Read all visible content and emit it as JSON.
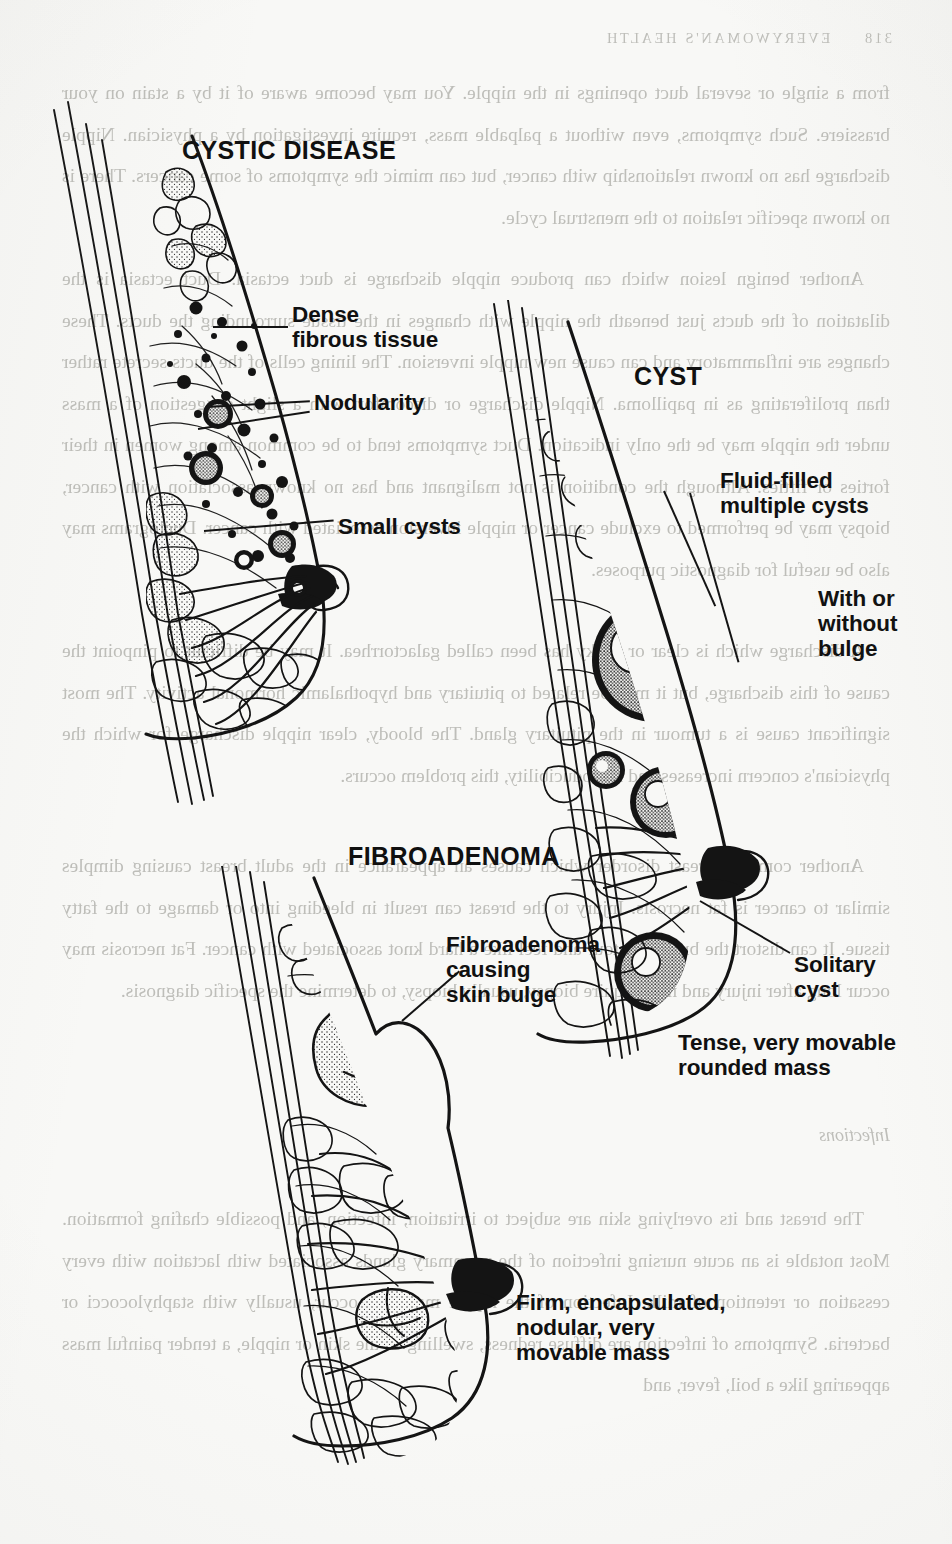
{
  "page": {
    "kind": "scanned-book-page",
    "width": 952,
    "height": 1544,
    "background_color": "#f8f8f6",
    "ink_color": "#141414",
    "bleed_text_color": "#9b9b95",
    "caption": "Breast disorders: cystic disease, cyst and fibroadenoma shown in sagittal cross-section"
  },
  "running_head": {
    "page_number": "318",
    "book_title": "EVERYWOMAN'S HEALTH"
  },
  "verso_text": {
    "note": "faint mirrored show-through from the reverse side of the leaf",
    "paragraphs": [
      "from a single or several duct openings in the nipple. You may become aware of it by a stain on your brassiere. Such symptoms, even without a palpable mass, require investigation by a physician. Nipple discharge has no known relationship with cancer, but can mimic the symptoms of some cancers. There is no known specific relation to the menstrual cycle.",
      "Another benign lesion which can produce nipple discharge is duct ectasia. Duct ectasia is the dilatation of the ducts just beneath the nipple with changes in the tissue surrounding the ducts. These changes are inflammatory and can cause new nipple inversion. The lining cells of the ducts secrete rather than proliferating as in papilloma. Nipple discharge or discomfort with a slight suggestion of a mass under the nipple may be the only indication. Duct symptoms tend to be common among women in their forties or fifties. Although the condition is not malignant and has no known association with cancer, biopsy may be performed to exclude cancer or nipple inversion associated with cancer. Ductograms may also be useful for diagnostic purposes.",
      "A discharge which is clear or milky has been called galactorrhea. It may be difficult to pinpoint the cause of this discharge, but it may be related to pituitary and hypothalamic hormonal activity. The most significant cause is a tumour in the pituitary gland. The bloody, clear nipple discharge for which the physician's concern increases and reproducibility, this problem occurs.",
      "Another common breast disorder which causes an appearance in the adult breast causing dimples similar to cancer is fat necrosis. Injury to the breast can result in bleeding into or damage to the fatty tissue. It can distort the breast contour and feel like a hard knot associated with cancer. Fat necrosis may occur long after injury and may require biopsy, usually biopsy, to determine the specific diagnosis."
    ],
    "section_heading": "Infections",
    "closing_paragraph": "The breast and its overlying skin are subject to irritation, infection, and possible chafing formation. Most notable is an acute nursing infection of the mammary glands associated with lactation with every cessation or retention of milk. Infection of the nipple may also occur, usually with staphylococci or bacteria. Symptoms of infection are diffuse redness, swelling of the skin or nipple, a tender painful mass appearing like a boil, fever, and"
  },
  "figure": {
    "panels": [
      {
        "id": "cystic-disease",
        "title": "CYSTIC DISEASE",
        "callouts": [
          {
            "id": "dense-fibrous-tissue",
            "text": "Dense\nfibrous tissue"
          },
          {
            "id": "nodularity",
            "text": "Nodularity"
          },
          {
            "id": "small-cysts",
            "text": "Small cysts"
          }
        ]
      },
      {
        "id": "cyst",
        "title": "CYST",
        "callouts": [
          {
            "id": "fluid-filled-multiple-cysts",
            "text": "Fluid-filled\nmultiple cysts"
          },
          {
            "id": "with-or-without-bulge",
            "text": "With or\nwithout\nbulge"
          },
          {
            "id": "solitary-cyst",
            "text": "Solitary\ncyst"
          },
          {
            "id": "tense-movable-mass",
            "text": "Tense, very movable\nrounded mass"
          }
        ]
      },
      {
        "id": "fibroadenoma",
        "title": "FIBROADENOMA",
        "callouts": [
          {
            "id": "fibroadenoma-skin-bulge",
            "text": "Fibroadenoma\ncausing\nskin bulge"
          },
          {
            "id": "firm-encapsulated-mass",
            "text": "Firm, encapsulated,\nnodular, very\nmovable mass"
          }
        ]
      }
    ]
  }
}
